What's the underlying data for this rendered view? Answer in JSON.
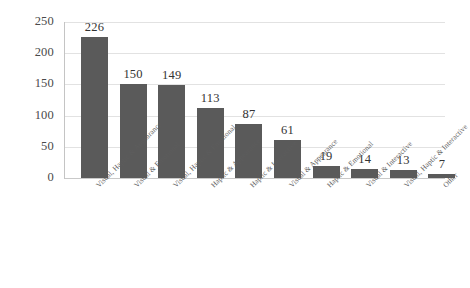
{
  "chart_data": {
    "type": "bar",
    "title": "",
    "subtitle": "",
    "xlabel": "",
    "ylabel": "",
    "ylim": [
      0,
      250
    ],
    "yticks": [
      0,
      50,
      100,
      150,
      200,
      250
    ],
    "grid": true,
    "legend": "none",
    "orientation": "vertical",
    "bar_color": "#5a5a5a",
    "gridline_color": "#e2e2e2",
    "label_rotation": -45,
    "categories": [
      "Visual, Haptic & Appearance",
      "Visual & Emotional",
      "Visual, Haptic & Emotional",
      "Haptic & Appearance",
      "Haptic & Interactive",
      "Visual & Appearance",
      "Haptic & Emotional",
      "Visual & Interactive",
      "Visual, Haptic & Interactive",
      "Other"
    ],
    "values": [
      226,
      150,
      149,
      113,
      87,
      61,
      19,
      14,
      13,
      7
    ],
    "value_labels": [
      "226",
      "150",
      "149",
      "113",
      "87",
      "61",
      "19",
      "14",
      "13",
      "7"
    ],
    "ytick_labels": [
      "250",
      "200",
      "150",
      "100",
      "50",
      "0"
    ]
  }
}
